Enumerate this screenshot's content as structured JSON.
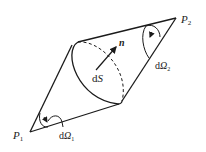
{
  "diagram": {
    "type": "double-cone solid angle illustration",
    "labels": {
      "p1": "P",
      "p1_sub": "1",
      "p2": "P",
      "p2_sub": "2",
      "n": "n",
      "ds_d": "d",
      "ds_s": "S",
      "domega1_d": "d",
      "domega1_omega": "Ω",
      "domega1_sub": "1",
      "domega2_d": "d",
      "domega2_omega": "Ω",
      "domega2_sub": "2"
    },
    "colors": {
      "stroke": "#1a1a1a",
      "text": "#222222",
      "background": "#ffffff"
    }
  }
}
